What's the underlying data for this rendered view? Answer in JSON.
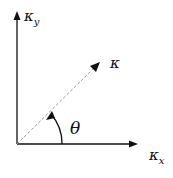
{
  "diagram": {
    "type": "vector-angle",
    "labels": {
      "y_axis": {
        "main": "κ",
        "sub": "y"
      },
      "x_axis": {
        "main": "κ",
        "sub": "x"
      },
      "vector": "κ",
      "angle": "θ"
    },
    "colors": {
      "axis": "#111111",
      "dashed": "#999999"
    }
  }
}
